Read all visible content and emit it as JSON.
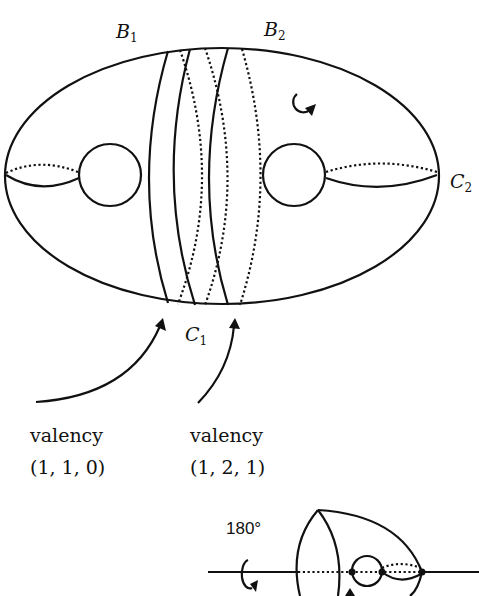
{
  "figure": {
    "labels": {
      "b1": "B",
      "b1_sub": "1",
      "b2": "B",
      "b2_sub": "2",
      "c1": "C",
      "c1_sub": "1",
      "c2": "C",
      "c2_sub": "2"
    },
    "annotations": [
      {
        "title": "valency",
        "value": "(1, 1, 0)"
      },
      {
        "title": "valency",
        "value": "(1, 2, 1)"
      }
    ],
    "rotation_label": "180°",
    "icons": [
      "rotation-arrow-icon",
      "pointer-arrow-icon"
    ],
    "colors": {
      "stroke": "#111111",
      "background": "#ffffff"
    }
  }
}
